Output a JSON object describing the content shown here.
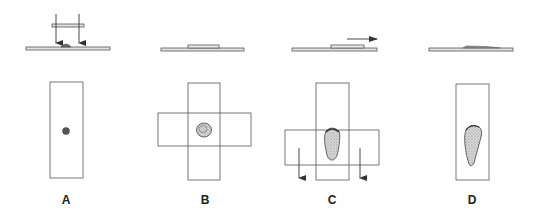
{
  "diagram": {
    "colors": {
      "line": "#555555",
      "slide_fill": "#e2e2e2",
      "specimen_dark": "#6a6a6a",
      "specimen_stipple": "#9a9a9a"
    },
    "panels": [
      {
        "id": "A",
        "label": "A",
        "step": "Drop placed on slide; second slide lowered onto it (arrows down)"
      },
      {
        "id": "B",
        "label": "B",
        "step": "Slides placed crosswise; specimen spreads between them"
      },
      {
        "id": "C",
        "label": "C",
        "step": "Top slide pulled horizontally (arrow right) while pressed down (arrows down)"
      },
      {
        "id": "D",
        "label": "D",
        "step": "Resulting teardrop-shaped smear on the slide"
      }
    ]
  }
}
